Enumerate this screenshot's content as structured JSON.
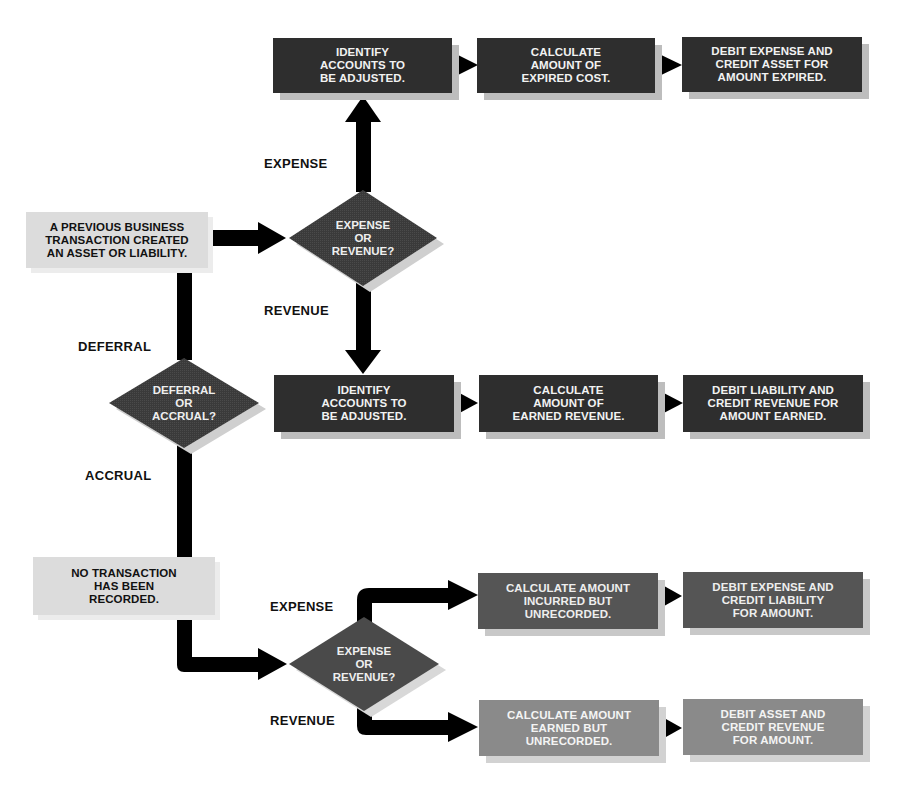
{
  "diagram": {
    "type": "flowchart",
    "colors": {
      "arrow": "#000000",
      "dark_box": "#2e2e2e",
      "mid_box": "#555555",
      "light_box": "#8a8a8a",
      "source_box": "#dcdcdc",
      "diamond": "#3a3a3a"
    },
    "sources": {
      "previous": "A PREVIOUS BUSINESS\nTRANSACTION CREATED\nAN ASSET OR LIABILITY.",
      "none": "NO TRANSACTION\nHAS BEEN\nRECORDED."
    },
    "decisions": {
      "deferral_expense_revenue": "EXPENSE\nOR\nREVENUE?",
      "deferral_or_accrual": "DEFERRAL\nOR\nACCRUAL?",
      "accrual_expense_revenue": "EXPENSE\nOR\nREVENUE?"
    },
    "branch_labels": {
      "top_expense": "EXPENSE",
      "top_revenue": "REVENUE",
      "deferral": "DEFERRAL",
      "accrual": "ACCRUAL",
      "bottom_expense": "EXPENSE",
      "bottom_revenue": "REVENUE"
    },
    "rows": {
      "deferral_expense": [
        "IDENTIFY\nACCOUNTS TO\nBE ADJUSTED.",
        "CALCULATE\nAMOUNT OF\nEXPIRED COST.",
        "DEBIT EXPENSE AND\nCREDIT ASSET FOR\nAMOUNT EXPIRED."
      ],
      "deferral_revenue": [
        "IDENTIFY\nACCOUNTS TO\nBE ADJUSTED.",
        "CALCULATE\nAMOUNT OF\nEARNED REVENUE.",
        "DEBIT LIABILITY AND\nCREDIT REVENUE FOR\nAMOUNT EARNED."
      ],
      "accrual_expense": [
        "CALCULATE AMOUNT\nINCURRED BUT\nUNRECORDED.",
        "DEBIT EXPENSE AND\nCREDIT LIABILITY\nFOR AMOUNT."
      ],
      "accrual_revenue": [
        "CALCULATE AMOUNT\nEARNED BUT\nUNRECORDED.",
        "DEBIT ASSET AND\nCREDIT REVENUE\nFOR AMOUNT."
      ]
    }
  }
}
